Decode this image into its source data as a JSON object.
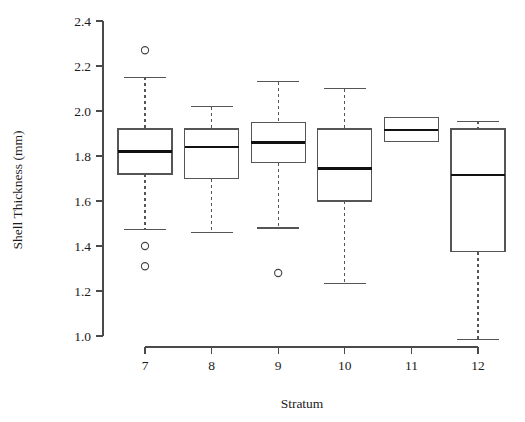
{
  "chart_data": {
    "type": "box",
    "title": "",
    "xlabel": "Stratum",
    "ylabel": "Shell Thickness (mm)",
    "categories": [
      "7",
      "8",
      "9",
      "10",
      "11",
      "12"
    ],
    "ylim": [
      0.95,
      2.45
    ],
    "yticks": [
      1.0,
      1.2,
      1.4,
      1.6,
      1.8,
      2.0,
      2.2,
      2.4
    ],
    "ytick_labels": [
      "1.0",
      "1.2",
      "1.4",
      "1.6",
      "1.8",
      "2.0",
      "2.2",
      "2.4"
    ],
    "grid": false,
    "legend": "none",
    "boxes": [
      {
        "category": "7",
        "whisker_low": 1.475,
        "q1": 1.72,
        "median": 1.82,
        "q3": 1.92,
        "whisker_high": 2.15,
        "outliers": [
          2.27,
          1.4,
          1.31
        ]
      },
      {
        "category": "8",
        "whisker_low": 1.46,
        "q1": 1.7,
        "median": 1.84,
        "q3": 1.92,
        "whisker_high": 2.02,
        "outliers": []
      },
      {
        "category": "9",
        "whisker_low": 1.48,
        "q1": 1.77,
        "median": 1.86,
        "q3": 1.95,
        "whisker_high": 2.13,
        "outliers": [
          1.28
        ]
      },
      {
        "category": "10",
        "whisker_low": 1.235,
        "q1": 1.6,
        "median": 1.745,
        "q3": 1.92,
        "whisker_high": 2.1,
        "outliers": []
      },
      {
        "category": "11",
        "whisker_low": 1.87,
        "q1": 1.865,
        "median": 1.915,
        "q3": 1.97,
        "whisker_high": 1.97,
        "outliers": []
      },
      {
        "category": "12",
        "whisker_low": 0.985,
        "q1": 1.375,
        "median": 1.715,
        "q3": 1.92,
        "whisker_high": 1.955,
        "outliers": []
      }
    ]
  },
  "axes": {
    "y_axis_label": "Shell Thickness (mm)",
    "x_axis_label": "Stratum"
  }
}
